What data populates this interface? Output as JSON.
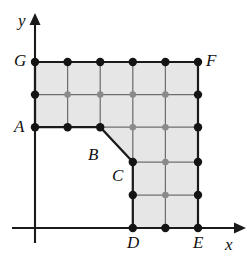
{
  "figure": {
    "type": "geometry-diagram"
  },
  "axes": {
    "x_label": "x",
    "y_label": "y",
    "x_axis_name": "horizontal-axis",
    "y_axis_name": "vertical-axis",
    "arrow_x_icon": "arrow-right-icon",
    "arrow_y_icon": "arrow-up-icon",
    "color": "#1a1a1a"
  },
  "colors": {
    "fill": "#e6e6e6",
    "boundary": "#1a1a1a",
    "grid": "#6e6e6e",
    "boundary_point": "#141414",
    "interior_point": "#8a8a8a",
    "background": "#ffffff"
  },
  "labels": [
    {
      "id": "G",
      "text": "G",
      "x": 14,
      "y": 52
    },
    {
      "id": "F",
      "text": "F",
      "x": 206,
      "y": 52
    },
    {
      "id": "A",
      "text": "A",
      "x": 14,
      "y": 118
    },
    {
      "id": "B",
      "text": "B",
      "x": 88,
      "y": 146
    },
    {
      "id": "C",
      "text": "C",
      "x": 112,
      "y": 167
    },
    {
      "id": "D",
      "text": "D",
      "x": 127,
      "y": 234
    },
    {
      "id": "E",
      "text": "E",
      "x": 193,
      "y": 234
    }
  ],
  "axis_labels": [
    {
      "id": "x",
      "text": "x",
      "x": 225,
      "y": 236
    },
    {
      "id": "y",
      "text": "y",
      "x": 18,
      "y": 12
    }
  ],
  "geometry": {
    "grid_step": 32.6,
    "columns_x": [
      35,
      67.6,
      100.2,
      132.8,
      165.4,
      198
    ],
    "rows_y": [
      62,
      94.6,
      127.2,
      162,
      195,
      228
    ],
    "polygon_vertices": [
      {
        "id": "G",
        "x": 35,
        "y": 62
      },
      {
        "id": "F",
        "x": 198,
        "y": 62
      },
      {
        "id": "E",
        "x": 198,
        "y": 228
      },
      {
        "id": "D",
        "x": 132.8,
        "y": 228
      },
      {
        "id": "C",
        "x": 132.8,
        "y": 162
      },
      {
        "id": "B",
        "x": 100.2,
        "y": 127.2
      },
      {
        "id": "A",
        "x": 35,
        "y": 127.2
      }
    ],
    "axis_origin": {
      "x": 35,
      "y": 228
    },
    "x_axis_end": 237,
    "y_axis_top": 22,
    "y_axis_bottom": 243,
    "boundary_points": [
      {
        "x": 35,
        "y": 62
      },
      {
        "x": 67.6,
        "y": 62
      },
      {
        "x": 100.2,
        "y": 62
      },
      {
        "x": 132.8,
        "y": 62
      },
      {
        "x": 165.4,
        "y": 62
      },
      {
        "x": 198,
        "y": 62
      },
      {
        "x": 35,
        "y": 94.6
      },
      {
        "x": 198,
        "y": 94.6
      },
      {
        "x": 35,
        "y": 127.2
      },
      {
        "x": 67.6,
        "y": 127.2
      },
      {
        "x": 100.2,
        "y": 127.2
      },
      {
        "x": 198,
        "y": 127.2
      },
      {
        "x": 132.8,
        "y": 162
      },
      {
        "x": 198,
        "y": 162
      },
      {
        "x": 132.8,
        "y": 195
      },
      {
        "x": 198,
        "y": 195
      },
      {
        "x": 132.8,
        "y": 228
      },
      {
        "x": 165.4,
        "y": 228
      },
      {
        "x": 198,
        "y": 228
      }
    ],
    "interior_points": [
      {
        "x": 67.6,
        "y": 94.6
      },
      {
        "x": 100.2,
        "y": 94.6
      },
      {
        "x": 132.8,
        "y": 94.6
      },
      {
        "x": 165.4,
        "y": 94.6
      },
      {
        "x": 132.8,
        "y": 127.2
      },
      {
        "x": 165.4,
        "y": 127.2
      },
      {
        "x": 165.4,
        "y": 162
      },
      {
        "x": 165.4,
        "y": 195
      }
    ],
    "grid_lines_vertical": [
      {
        "x": 67.6,
        "y1": 62,
        "y2": 127.2
      },
      {
        "x": 100.2,
        "y1": 62,
        "y2": 127.2
      },
      {
        "x": 132.8,
        "y1": 62,
        "y2": 228
      },
      {
        "x": 165.4,
        "y1": 62,
        "y2": 228
      }
    ],
    "grid_lines_horizontal": [
      {
        "y": 94.6,
        "x1": 35,
        "x2": 198
      },
      {
        "y": 127.2,
        "x1": 100.2,
        "x2": 198
      },
      {
        "y": 162,
        "x1": 132.8,
        "x2": 198
      },
      {
        "y": 195,
        "x1": 132.8,
        "x2": 198
      }
    ]
  }
}
